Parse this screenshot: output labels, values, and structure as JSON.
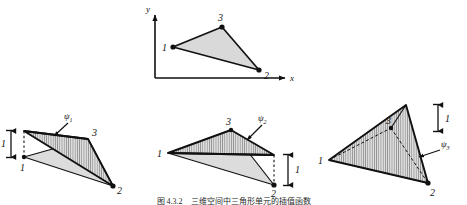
{
  "figure": {
    "caption": "图 4.3.2　三维空间中三角形单元的插值函数",
    "background_color": "#ffffff",
    "ink_color": "#111111",
    "fill_light": "#d9d9d9",
    "fill_hatch": "#c9c9c9"
  },
  "top_panel": {
    "name": "triangular-element-in-xy-plane",
    "axes": {
      "y_label": "y",
      "x_label": "x"
    },
    "vertices": [
      {
        "label": "1"
      },
      {
        "label": "2"
      },
      {
        "label": "3"
      }
    ]
  },
  "panels": [
    {
      "name": "psi-1",
      "function_label": "ψ",
      "function_subscript": "1",
      "dimension_label": "1",
      "raised_vertex": "1",
      "vertices": [
        {
          "label": "1"
        },
        {
          "label": "2"
        },
        {
          "label": "3"
        }
      ]
    },
    {
      "name": "psi-2",
      "function_label": "ψ",
      "function_subscript": "2",
      "dimension_label": "1",
      "raised_vertex": "2",
      "vertices": [
        {
          "label": "1"
        },
        {
          "label": "2"
        },
        {
          "label": "3"
        }
      ]
    },
    {
      "name": "psi-3",
      "function_label": "ψ",
      "function_subscript": "3",
      "dimension_label": "1",
      "raised_vertex": "3",
      "vertices": [
        {
          "label": "1"
        },
        {
          "label": "2"
        },
        {
          "label": "3"
        }
      ]
    }
  ]
}
